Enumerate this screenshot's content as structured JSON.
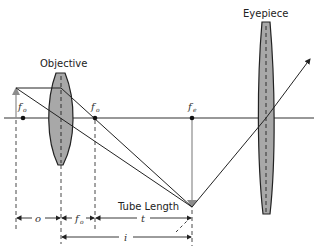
{
  "diagram": {
    "labels": {
      "objective": "Objective",
      "eyepiece": "Eyepiece",
      "tube_length": "Tube Length"
    },
    "focal_points": {
      "objective_left": {
        "symbol": "f",
        "subscript": "o"
      },
      "objective_right": {
        "symbol": "f",
        "subscript": "o"
      },
      "eyepiece": {
        "symbol": "f",
        "subscript": "e"
      }
    },
    "dimensions": {
      "o": "o",
      "fo": {
        "symbol": "f",
        "subscript": "o"
      },
      "t": "t",
      "i": "i"
    },
    "colors": {
      "line": "#222222",
      "lens_fill": "#a8a8a8",
      "arrow_gray": "#8c8c8c",
      "axis": "#333333"
    }
  }
}
